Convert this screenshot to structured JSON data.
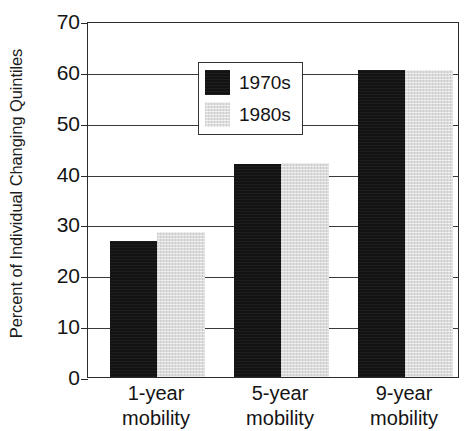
{
  "chart_data": {
    "type": "bar",
    "title": "",
    "subtitle": "",
    "xlabel": "",
    "ylabel": "Percent of Individual Changing Quintiles",
    "categories": [
      "1-year mobility",
      "5-year mobility",
      "9-year mobility"
    ],
    "category_lines": [
      [
        "1-year",
        "mobility"
      ],
      [
        "5-year",
        "mobility"
      ],
      [
        "9-year",
        "mobility"
      ]
    ],
    "series": [
      {
        "name": "1970s",
        "values": [
          26.7,
          41.8,
          60.3
        ],
        "color": "#131313"
      },
      {
        "name": "1980s",
        "values": [
          28.5,
          42.0,
          60.4
        ],
        "color": "#dcdcdc"
      }
    ],
    "ylim": [
      0,
      70
    ],
    "yticks": [
      0,
      10,
      20,
      30,
      40,
      50,
      60,
      70
    ],
    "ytick_labels": [
      "0",
      "10",
      "20",
      "30",
      "40",
      "50",
      "60",
      "70"
    ],
    "grid": true,
    "grid_axis": "y",
    "legend_position": "upper left inside plot",
    "legend_boxed": true,
    "bar_group_gap": true,
    "annotations": []
  }
}
